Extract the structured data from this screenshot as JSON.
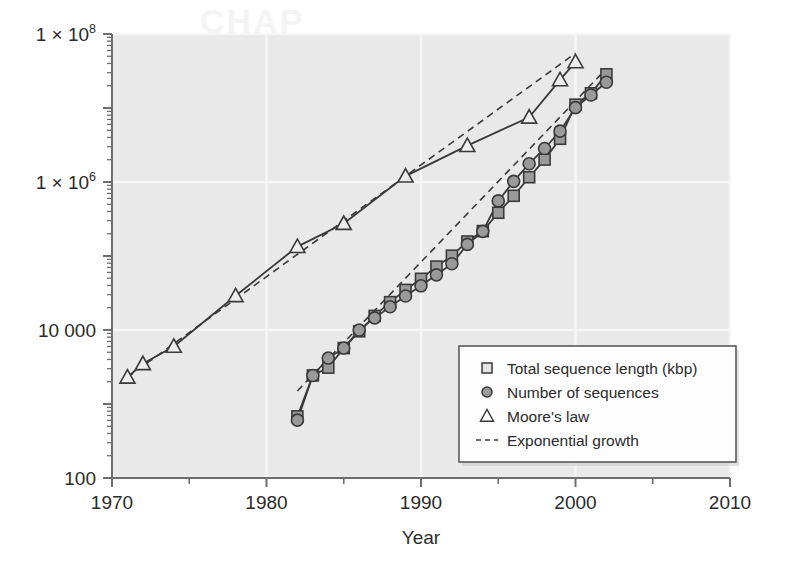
{
  "chart_data": {
    "type": "line",
    "title": "",
    "subtitle": "",
    "xlabel": "Year",
    "ylabel": "",
    "xlim": [
      1970,
      2010
    ],
    "ylim": [
      100,
      100000000
    ],
    "yscale": "log",
    "xscale": "linear",
    "grid": true,
    "legend_position": "bottom-right",
    "x_ticks": [
      "1970",
      "1980",
      "1990",
      "2000",
      "2010"
    ],
    "x_tick_values": [
      1970,
      1980,
      1990,
      2000,
      2010
    ],
    "x_minor_tick_values": [
      1975,
      1985,
      1995,
      2005
    ],
    "y_ticks": [
      "1 × 10⁸",
      "1 × 10⁶",
      "10 000",
      "100"
    ],
    "y_tick_values": [
      100000000,
      1000000,
      10000,
      100
    ],
    "y_tick_parts": [
      {
        "mantissa": "1 × 10",
        "exp": "8"
      },
      {
        "mantissa": "1 × 10",
        "exp": "6"
      },
      {
        "plain": "10 000"
      },
      {
        "plain": "100"
      }
    ],
    "series": [
      {
        "name": "Total sequence length (kbp)",
        "marker": "square",
        "linestyle": "solid",
        "x": [
          1982,
          1983,
          1984,
          1985,
          1986,
          1987,
          1988,
          1989,
          1990,
          1991,
          1992,
          1993,
          1994,
          1995,
          1996,
          1997,
          1998,
          1999,
          2000,
          2001,
          2002
        ],
        "y": [
          680,
          2430,
          3100,
          5700,
          9600,
          15500,
          23800,
          34800,
          49200,
          71900,
          101000,
          157000,
          217000,
          384000,
          651000,
          1160000,
          2010000,
          3840000,
          11100000,
          15800000,
          28500000
        ]
      },
      {
        "name": "Number of sequences",
        "marker": "circle",
        "linestyle": "solid",
        "x": [
          1982,
          1983,
          1984,
          1985,
          1986,
          1987,
          1988,
          1989,
          1990,
          1991,
          1992,
          1993,
          1994,
          1995,
          1996,
          1997,
          1998,
          1999,
          2000,
          2001,
          2002
        ],
        "y": [
          606,
          2427,
          4175,
          5700,
          9978,
          14584,
          20579,
          28791,
          39533,
          55627,
          78608,
          143492,
          215273,
          555694,
          1021211,
          1765847,
          2837897,
          4864570,
          10106023,
          14976310,
          22318883
        ]
      },
      {
        "name": "Moore's law",
        "marker": "triangle",
        "linestyle": "solid",
        "x": [
          1971,
          1972,
          1974,
          1978,
          1982,
          1985,
          1989,
          1993,
          1997,
          1999,
          2000
        ],
        "y": [
          2300,
          3500,
          6000,
          29000,
          134000,
          275000,
          1200000,
          3100000,
          7500000,
          24000000,
          42000000
        ]
      },
      {
        "name": "Exponential growth",
        "marker": "none",
        "linestyle": "dashed",
        "comment": "two reference dashed trend lines: one fitted to Moore's law, one fitted to the GenBank series",
        "fits": [
          {
            "x": [
              1971,
              2000
            ],
            "y": [
              2300,
              55000000
            ]
          },
          {
            "x": [
              1982,
              2002
            ],
            "y": [
              1500,
              34000000
            ]
          }
        ]
      }
    ],
    "legend_entries": [
      {
        "label": "Total sequence length (kbp)",
        "marker": "square"
      },
      {
        "label": "Number of sequences",
        "marker": "circle"
      },
      {
        "label": "Moore's law",
        "marker": "triangle"
      },
      {
        "label": "Exponential growth",
        "marker": "dashed-line"
      }
    ],
    "colors": {
      "plot_background": "#e9e9e9",
      "page_background": "#ffffff",
      "gridline": "#f6f6f6",
      "axis": "#6e6e6e",
      "line": "#3a3a3a",
      "marker_fill": "#9a9a9a",
      "marker_stroke": "#3a3a3a",
      "text": "#2b2b2b",
      "legend_background": "#fdfdfd",
      "legend_border": "#5a5a5a"
    }
  },
  "ghost": {
    "bleed_text": "CHAP"
  }
}
